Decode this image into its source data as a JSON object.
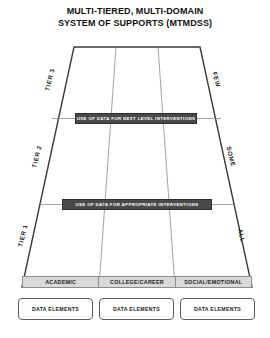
{
  "title": {
    "line1": "MULTI-TIERED, MULTI-DOMAIN",
    "line2": "SYSTEM OF SUPPORTS (MTMDSS)"
  },
  "tiers": [
    {
      "id": "tier-3",
      "label": "TIER 3",
      "reach_label": "FEW"
    },
    {
      "id": "tier-2",
      "label": "TIER 2",
      "reach_label": "SOME"
    },
    {
      "id": "tier-1",
      "label": "TIER 1",
      "reach_label": "ALL"
    }
  ],
  "banners": [
    {
      "id": "banner-tier3",
      "text": "USE OF DATA FOR NEXT LEVEL INTERVENTIONS"
    },
    {
      "id": "banner-tier2",
      "text": "USE OF DATA FOR APPROPRIATE INTERVENTIONS"
    }
  ],
  "domains": [
    {
      "id": "academic",
      "label": "ACADEMIC",
      "data_elements_label": "DATA ELEMENTS"
    },
    {
      "id": "college-career",
      "label": "COLLEGE/CAREER",
      "data_elements_label": "DATA ELEMENTS"
    },
    {
      "id": "social-emotional",
      "label": "SOCIAL/EMOTIONAL",
      "data_elements_label": "DATA ELEMENTS"
    }
  ],
  "colors": {
    "banner_fill": "#4a4a4a",
    "banner_text": "#ffffff",
    "domain_band_fill": "#d9d9d9",
    "outline": "#3a3a3a",
    "background": "#ffffff"
  }
}
